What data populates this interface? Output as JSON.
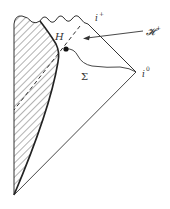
{
  "diagram": {
    "type": "penrose-diagram",
    "labels": {
      "H": "H",
      "future_horizon": "𝓗",
      "future_horizon_sup": "+",
      "i_plus": "i",
      "i_plus_sup": "+",
      "i_zero": "i",
      "i_zero_sup": "0",
      "sigma": "Σ"
    },
    "regions": [
      {
        "name": "collapsing-star-interior",
        "fill": "hatched"
      }
    ],
    "colors": {
      "stroke": "#333333",
      "hatch": "#555555",
      "background": "#ffffff"
    }
  }
}
